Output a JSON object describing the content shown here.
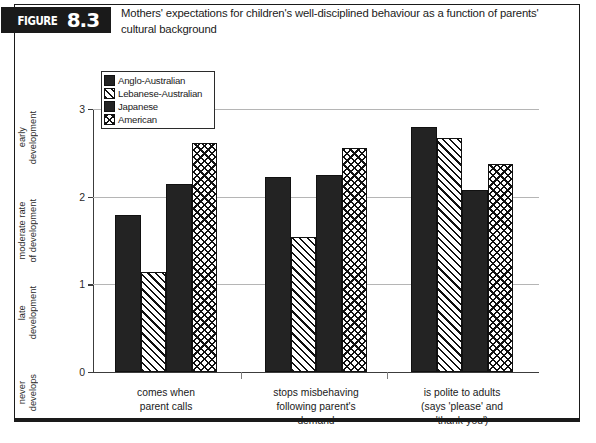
{
  "figure": {
    "tag_word": "FIGURE",
    "tag_number": "8.3",
    "title": "Mothers' expectations for children's well-disciplined behaviour as a function of parents' cultural background"
  },
  "legend": {
    "items": [
      {
        "label": "Anglo-Australian",
        "pattern": "solid-black"
      },
      {
        "label": "Lebanese-Australian",
        "pattern": "diagonal-hatch"
      },
      {
        "label": "Japanese",
        "pattern": "solid-black"
      },
      {
        "label": "American",
        "pattern": "cross-hatch"
      }
    ]
  },
  "chart_data": {
    "type": "bar",
    "title": "Mothers' expectations for children's well-disciplined behaviour as a function of parents' cultural background",
    "xlabel": "",
    "ylabel": "",
    "ylim": [
      0,
      3
    ],
    "yticks": [
      0,
      1,
      2,
      3
    ],
    "ytick_labels": [
      "0",
      "1",
      "2",
      "3"
    ],
    "y_descriptors": [
      {
        "value": 3,
        "text": "early\ndevelopment"
      },
      {
        "value": 2,
        "text": "moderate rate\nof development"
      },
      {
        "value": 1,
        "text": "late\ndevelopment"
      },
      {
        "value": 0,
        "text": "never\ndevelops"
      }
    ],
    "grid": true,
    "legend_position": "upper-left-inside",
    "categories": [
      "comes when\nparent calls",
      "stops misbehaving\nfollowing parent's\ndemand",
      "is polite to adults\n(says 'please' and\n'thank-you')"
    ],
    "series": [
      {
        "name": "Anglo-Australian",
        "pattern": "solid-black",
        "values": [
          1.79,
          2.23,
          2.79
        ]
      },
      {
        "name": "Lebanese-Australian",
        "pattern": "diagonal-hatch",
        "values": [
          1.14,
          1.54,
          2.67
        ]
      },
      {
        "name": "Japanese",
        "pattern": "solid-black",
        "values": [
          2.15,
          2.25,
          2.08
        ]
      },
      {
        "name": "American",
        "pattern": "cross-hatch",
        "values": [
          2.61,
          2.55,
          2.37
        ]
      }
    ]
  },
  "colors": {
    "ink": "#1a1a1a",
    "grid": "#b5b5b5",
    "axis": "#3c3c3c",
    "bar_solid": "#232323",
    "background": "#ffffff"
  }
}
